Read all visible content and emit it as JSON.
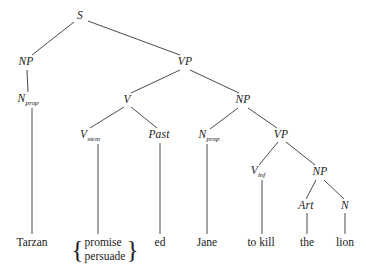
{
  "diagram": {
    "kind": "syntax-tree",
    "background_color": "#ffffff",
    "line_color": "#4a4a4a",
    "text_color": "#1a1a1a"
  },
  "nodes": [
    {
      "id": "s",
      "label": "S",
      "sub": "",
      "x": 80,
      "y": 16
    },
    {
      "id": "np1",
      "label": "NP",
      "sub": "",
      "x": 26,
      "y": 62
    },
    {
      "id": "vp1",
      "label": "VP",
      "sub": "",
      "x": 185,
      "y": 62
    },
    {
      "id": "nprop1",
      "label": "N",
      "sub": "prop",
      "x": 28,
      "y": 100
    },
    {
      "id": "v",
      "label": "V",
      "sub": "",
      "x": 127,
      "y": 100
    },
    {
      "id": "np2",
      "label": "NP",
      "sub": "",
      "x": 243,
      "y": 100
    },
    {
      "id": "vstem",
      "label": "V",
      "sub": "stem",
      "x": 90,
      "y": 136
    },
    {
      "id": "past",
      "label": "Past",
      "sub": "",
      "x": 159,
      "y": 135
    },
    {
      "id": "nprop2",
      "label": "N",
      "sub": "prop",
      "x": 209,
      "y": 136
    },
    {
      "id": "vp2",
      "label": "VP",
      "sub": "",
      "x": 281,
      "y": 135
    },
    {
      "id": "vinf",
      "label": "V",
      "sub": "inf",
      "x": 258,
      "y": 172
    },
    {
      "id": "np3",
      "label": "NP",
      "sub": "",
      "x": 320,
      "y": 172
    },
    {
      "id": "art",
      "label": "Art",
      "sub": "",
      "x": 306,
      "y": 206
    },
    {
      "id": "n",
      "label": "N",
      "sub": "",
      "x": 345,
      "y": 206
    }
  ],
  "leaves": [
    {
      "id": "leaf-tarzan",
      "text": "Tarzan",
      "x": 32,
      "y": 243
    },
    {
      "id": "leaf-ed",
      "text": "ed",
      "x": 160,
      "y": 243
    },
    {
      "id": "leaf-jane",
      "text": "Jane",
      "x": 207,
      "y": 243
    },
    {
      "id": "leaf-to-kill",
      "text": "to kill",
      "x": 261,
      "y": 243
    },
    {
      "id": "leaf-the",
      "text": "the",
      "x": 307,
      "y": 243
    },
    {
      "id": "leaf-lion",
      "text": "lion",
      "x": 345,
      "y": 243
    }
  ],
  "brace_leaf": {
    "id": "leaf-promise-persuade",
    "x": 105,
    "y": 250,
    "open": "{",
    "close": "}",
    "items": [
      "promise",
      "persuade"
    ]
  },
  "edges": [
    {
      "from": "s",
      "to": "np1",
      "x1": 74,
      "y1": 22,
      "x2": 32,
      "y2": 55
    },
    {
      "from": "s",
      "to": "vp1",
      "x1": 88,
      "y1": 21,
      "x2": 180,
      "y2": 55
    },
    {
      "from": "np1",
      "to": "nprop1",
      "x1": 27,
      "y1": 70,
      "x2": 28,
      "y2": 92
    },
    {
      "from": "vp1",
      "to": "v",
      "x1": 180,
      "y1": 70,
      "x2": 131,
      "y2": 93
    },
    {
      "from": "vp1",
      "to": "np2",
      "x1": 190,
      "y1": 70,
      "x2": 239,
      "y2": 93
    },
    {
      "from": "v",
      "to": "vstem",
      "x1": 124,
      "y1": 107,
      "x2": 90,
      "y2": 128
    },
    {
      "from": "v",
      "to": "past",
      "x1": 131,
      "y1": 107,
      "x2": 157,
      "y2": 128
    },
    {
      "from": "np2",
      "to": "nprop2",
      "x1": 238,
      "y1": 108,
      "x2": 210,
      "y2": 129
    },
    {
      "from": "np2",
      "to": "vp2",
      "x1": 248,
      "y1": 108,
      "x2": 277,
      "y2": 128
    },
    {
      "from": "vp2",
      "to": "vinf",
      "x1": 278,
      "y1": 142,
      "x2": 259,
      "y2": 165
    },
    {
      "from": "vp2",
      "to": "np3",
      "x1": 286,
      "y1": 142,
      "x2": 315,
      "y2": 165
    },
    {
      "from": "np3",
      "to": "art",
      "x1": 316,
      "y1": 180,
      "x2": 306,
      "y2": 199
    },
    {
      "from": "np3",
      "to": "n",
      "x1": 324,
      "y1": 180,
      "x2": 344,
      "y2": 199
    },
    {
      "from": "nprop1",
      "to": "leaf-tarzan",
      "x1": 32,
      "y1": 108,
      "x2": 32,
      "y2": 234
    },
    {
      "from": "vstem",
      "to": "leaf-brace",
      "x1": 98,
      "y1": 144,
      "x2": 98,
      "y2": 234
    },
    {
      "from": "past",
      "to": "leaf-ed",
      "x1": 160,
      "y1": 143,
      "x2": 160,
      "y2": 234
    },
    {
      "from": "nprop2",
      "to": "leaf-jane",
      "x1": 207,
      "y1": 144,
      "x2": 207,
      "y2": 234
    },
    {
      "from": "vinf",
      "to": "leaf-to-kill",
      "x1": 262,
      "y1": 180,
      "x2": 262,
      "y2": 234
    },
    {
      "from": "art",
      "to": "leaf-the",
      "x1": 307,
      "y1": 213,
      "x2": 307,
      "y2": 234
    },
    {
      "from": "n",
      "to": "leaf-lion",
      "x1": 345,
      "y1": 213,
      "x2": 345,
      "y2": 234
    }
  ]
}
